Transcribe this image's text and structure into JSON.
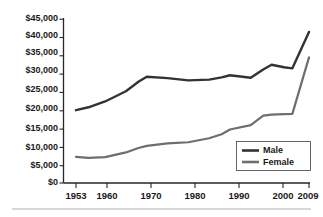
{
  "chart_data": {
    "type": "line",
    "title": "",
    "subtitle": "",
    "xlabel": "",
    "ylabel": "",
    "xlim": [
      1953,
      2009
    ],
    "ylim": [
      0,
      45000
    ],
    "grid": false,
    "legend_position": "bottom-right",
    "x_tick_labels": [
      "1953",
      "1960",
      "1970",
      "1980",
      "1990",
      "2000",
      "2009"
    ],
    "x_ticks": [
      1953,
      1960,
      1970,
      1980,
      1990,
      2000,
      2009
    ],
    "y_tick_labels": [
      "$0",
      "$5,000",
      "$10,000",
      "$15,000",
      "$20,000",
      "$25,000",
      "$30,000",
      "$35,000",
      "$40,000",
      "$45,000"
    ],
    "y_ticks": [
      0,
      5000,
      10000,
      15000,
      20000,
      25000,
      30000,
      35000,
      40000,
      45000
    ],
    "series": [
      {
        "name": "Male",
        "color": "#333333",
        "x": [
          1953,
          1956,
          1960,
          1965,
          1968,
          1970,
          1975,
          1980,
          1985,
          1988,
          1990,
          1995,
          1998,
          2000,
          2003,
          2005,
          2009
        ],
        "values": [
          20000,
          20800,
          22400,
          25200,
          27800,
          29200,
          28800,
          28200,
          28400,
          29000,
          29600,
          28900,
          31200,
          32500,
          31800,
          31500,
          41500
        ]
      },
      {
        "name": "Female",
        "color": "#6e6e6e",
        "x": [
          1953,
          1956,
          1960,
          1965,
          1968,
          1970,
          1975,
          1980,
          1985,
          1988,
          1990,
          1995,
          1998,
          2000,
          2003,
          2005,
          2009
        ],
        "values": [
          7200,
          6900,
          7100,
          8400,
          9600,
          10200,
          10900,
          11200,
          12300,
          13400,
          14700,
          15900,
          18500,
          18800,
          18900,
          19000,
          34500
        ]
      }
    ]
  },
  "legend": {
    "entries": [
      {
        "label": "Male"
      },
      {
        "label": "Female"
      }
    ]
  }
}
